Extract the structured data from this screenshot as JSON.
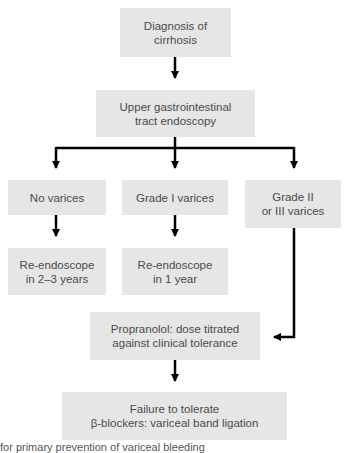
{
  "diagram": {
    "type": "flowchart",
    "nodes": {
      "diagnosis": "Diagnosis of\ncirrhosis",
      "endoscopy": "Upper gastrointestinal\ntract endoscopy",
      "no_varices": "No varices",
      "grade1": "Grade I varices",
      "grade23": "Grade II\nor III varices",
      "reendo_2_3": "Re-endoscope\nin 2–3 years",
      "reendo_1": "Re-endoscope\nin 1 year",
      "propranolol": "Propranolol: dose titrated\nagainst clinical tolerance",
      "failure": "Failure to tolerate\nβ-blockers: variceal band ligation"
    },
    "edges": [
      [
        "diagnosis",
        "endoscopy"
      ],
      [
        "endoscopy",
        "no_varices"
      ],
      [
        "endoscopy",
        "grade1"
      ],
      [
        "endoscopy",
        "grade23"
      ],
      [
        "no_varices",
        "reendo_2_3"
      ],
      [
        "grade1",
        "reendo_1"
      ],
      [
        "grade23",
        "propranolol"
      ],
      [
        "propranolol",
        "failure"
      ]
    ],
    "caption": "for primary prevention of variceal bleeding"
  },
  "colors": {
    "box_fill": "#e6e6e6",
    "line": "#000000",
    "text": "#4a4a4a"
  }
}
